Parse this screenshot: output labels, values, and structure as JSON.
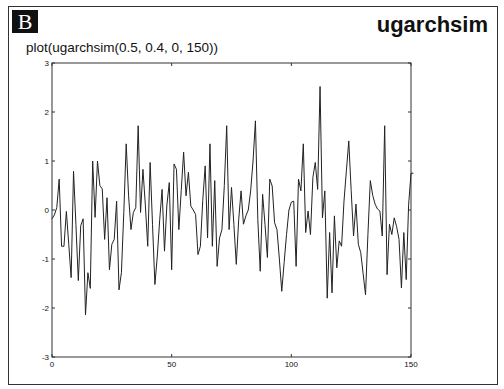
{
  "header": {
    "badge": "B",
    "title": "ugarchsim",
    "subtitle": "plot(ugarchsim(0.5, 0.4, 0, 150))"
  },
  "chart_data": {
    "type": "line",
    "title": "plot(ugarchsim(0.5, 0.4, 0, 150))",
    "xlabel": "",
    "ylabel": "",
    "xlim": [
      0,
      150
    ],
    "ylim": [
      -3,
      3
    ],
    "xticks": [
      0,
      50,
      100,
      150
    ],
    "yticks": [
      -3,
      -2,
      -1,
      0,
      1,
      2,
      3
    ],
    "grid": false,
    "legend": null,
    "line_color": "#222222",
    "series": [
      {
        "name": "ugarchsim",
        "values": [
          -0.18,
          -0.1,
          0.05,
          0.63,
          -0.74,
          -0.74,
          -0.03,
          -0.7,
          -1.38,
          0.79,
          -0.3,
          -1.44,
          -0.32,
          -0.18,
          -2.14,
          -1.28,
          -1.6,
          1.0,
          -0.15,
          1.0,
          0.5,
          0.43,
          -0.6,
          0.25,
          -1.22,
          -0.7,
          -0.6,
          0.18,
          -1.63,
          -1.28,
          -0.05,
          1.35,
          0.29,
          -0.4,
          -0.05,
          0.05,
          1.72,
          -0.05,
          0.83,
          0.1,
          -0.74,
          0.97,
          -0.3,
          -1.52,
          -0.94,
          -0.2,
          0.42,
          -0.84,
          0.1,
          0.56,
          -1.22,
          0.94,
          0.83,
          -0.4,
          0.4,
          1.18,
          0.29,
          0.77,
          0.08,
          0.0,
          -0.09,
          -0.91,
          -0.74,
          0.2,
          0.9,
          -0.57,
          1.35,
          -0.74,
          0.6,
          -1.15,
          -0.57,
          -0.4,
          0.5,
          1.72,
          -0.4,
          0.46,
          -0.3,
          -1.11,
          -0.2,
          0.39,
          -0.29,
          -0.12,
          0.0,
          0.39,
          1.0,
          1.82,
          -0.2,
          -1.25,
          0.32,
          -0.3,
          -0.97,
          0.63,
          0.49,
          -0.26,
          -0.4,
          -1.0,
          -1.66,
          -1.07,
          -0.5,
          0.0,
          0.16,
          0.18,
          -1.15,
          0.63,
          0.39,
          1.35,
          -0.46,
          -0.02,
          -0.5,
          0.66,
          0.97,
          0.42,
          2.52,
          -0.16,
          0.39,
          -1.8,
          -0.46,
          -1.69,
          -0.12,
          -1.18,
          -0.63,
          -0.74,
          0.18,
          0.8,
          1.41,
          0.4,
          -0.53,
          0.12,
          -0.7,
          -0.87,
          -1.3,
          -1.73,
          -0.5,
          0.6,
          0.3,
          0.12,
          0.02,
          -0.02,
          -0.53,
          1.72,
          -1.32,
          -0.29,
          -0.5,
          -0.16,
          -0.34,
          -0.6,
          -1.59,
          -0.46,
          -1.42,
          0.1,
          0.75,
          0.75
        ]
      }
    ]
  }
}
